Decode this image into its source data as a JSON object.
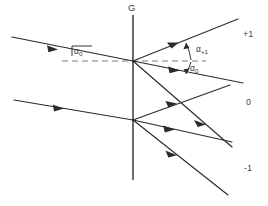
{
  "figure": {
    "type": "optical-ray-diagram",
    "background_color": "#ffffff",
    "ink_color": "#2b2b2b",
    "dash_color": "#7d7d7d"
  },
  "labels": {
    "grating": "G",
    "incidence_angle": "α",
    "incidence_angle_sub": "0",
    "diffraction_angle_plus1": "α",
    "diffraction_angle_plus1_sub": "+1",
    "diffraction_angle_zero": "α",
    "diffraction_angle_zero_sub": "0"
  },
  "orders": [
    {
      "name": "order-plus-one",
      "label": "+1"
    },
    {
      "name": "order-zero",
      "label": "0"
    },
    {
      "name": "order-minus-one",
      "label": "-1"
    }
  ],
  "geometry": {
    "grating": {
      "x": 133,
      "y_top": 15,
      "y_bottom": 180
    },
    "vertex_upper": {
      "x": 133,
      "y": 61
    },
    "vertex_lower": {
      "x": 133,
      "y": 120
    },
    "dashed_axis_upper": {
      "x1": 62,
      "y1": 61,
      "x2": 206,
      "y2": 61
    },
    "incident_rays": [
      {
        "name": "incident-ray-upper",
        "x1": 12,
        "y1": 37,
        "x2": 133,
        "y2": 61
      },
      {
        "name": "incident-ray-lower",
        "x1": 14,
        "y1": 100,
        "x2": 133,
        "y2": 120
      }
    ],
    "diffracted_rays": [
      {
        "name": "diffracted-ray-upper-plus1",
        "x1": 133,
        "y1": 61,
        "x2": 238,
        "y2": 19
      },
      {
        "name": "diffracted-ray-upper-zero",
        "x1": 133,
        "y1": 61,
        "x2": 243,
        "y2": 83
      },
      {
        "name": "diffracted-ray-upper-minus1",
        "x1": 133,
        "y1": 61,
        "x2": 232,
        "y2": 147
      },
      {
        "name": "diffracted-ray-lower-plus1",
        "x1": 133,
        "y1": 120,
        "x2": 230,
        "y2": 85
      },
      {
        "name": "diffracted-ray-lower-zero",
        "x1": 133,
        "y1": 120,
        "x2": 232,
        "y2": 142
      },
      {
        "name": "diffracted-ray-lower-minus1",
        "x1": 133,
        "y1": 120,
        "x2": 228,
        "y2": 195
      }
    ]
  }
}
